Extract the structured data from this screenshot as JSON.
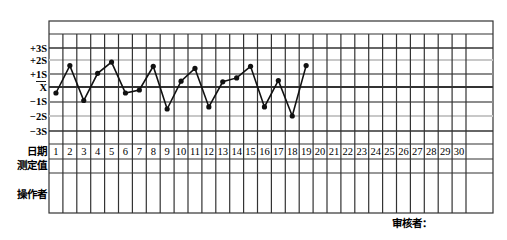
{
  "chart_data": {
    "type": "line",
    "title": "",
    "chart_kind": "Levey-Jennings quality control chart",
    "xlabel": "日期",
    "ylabel": "",
    "y_tick_labels": [
      "+3S",
      "+2S",
      "+1S",
      "X̄",
      "-1S",
      "-2S",
      "-3S"
    ],
    "y_tick_values": [
      3,
      2,
      1,
      0,
      -1,
      -2,
      -3
    ],
    "ylim": [
      -3,
      3
    ],
    "x": [
      1,
      2,
      3,
      4,
      5,
      6,
      7,
      8,
      9,
      10,
      11,
      12,
      13,
      14,
      15,
      16,
      17,
      18,
      19,
      20,
      21,
      22,
      23,
      24,
      25,
      26,
      27,
      28,
      29,
      30
    ],
    "series": [
      {
        "name": "QC measurement (SD units)",
        "x": [
          1,
          2,
          3,
          4,
          5,
          6,
          7,
          8,
          9,
          10,
          11,
          12,
          13,
          14,
          15,
          16,
          17,
          18,
          19
        ],
        "values": [
          -0.4,
          1.6,
          -0.9,
          1.05,
          1.85,
          -0.4,
          -0.2,
          1.55,
          -1.5,
          0.45,
          1.4,
          -1.35,
          0.4,
          0.7,
          1.55,
          -1.35,
          0.5,
          -2.0,
          1.6
        ]
      }
    ],
    "grid": true,
    "legend": "none"
  },
  "table": {
    "row_labels": {
      "date": "日期",
      "measured": "测定值",
      "operator": "操作者"
    },
    "days": [
      "1",
      "2",
      "3",
      "4",
      "5",
      "6",
      "7",
      "8",
      "9",
      "10",
      "11",
      "12",
      "13",
      "14",
      "15",
      "16",
      "17",
      "18",
      "19",
      "20",
      "21",
      "22",
      "23",
      "24",
      "25",
      "26",
      "27",
      "28",
      "29",
      "30"
    ]
  },
  "axis_labels": {
    "p3": "+3S",
    "p2": "+2S",
    "p1": "+1S",
    "mean": "X",
    "m1": "−1S",
    "m2": "−2S",
    "m3": "−3S"
  },
  "footer": {
    "reviewer": "审核者："
  },
  "colors": {
    "line": "#111111",
    "grid_dark": "#333333",
    "grid_gray": "#8c8c8c",
    "grid_light": "#c8c8c8"
  }
}
